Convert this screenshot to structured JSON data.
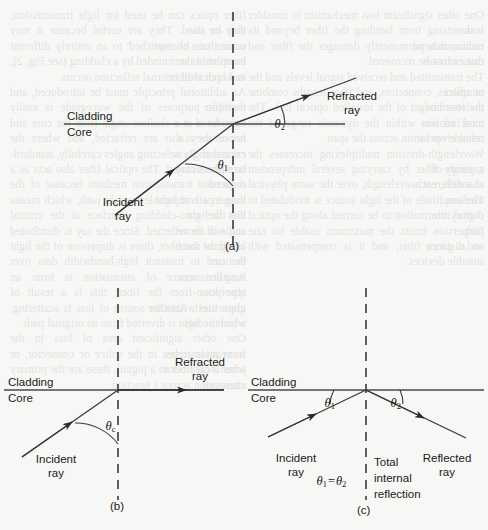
{
  "figure": {
    "kind": "optics-refraction-total-internal-reflection",
    "background_color": "#f7f7f5",
    "ink_color": "#2b2b2b",
    "panels": [
      {
        "id": "a",
        "id_label": "(a)",
        "interface_labels": {
          "upper": "Cladding",
          "lower": "Core"
        },
        "rays": [
          {
            "name": "incident",
            "label": "Incident\nray",
            "label_line1": "Incident",
            "label_line2": "ray"
          },
          {
            "name": "refracted",
            "label": "Refracted\nray",
            "label_line1": "Refracted",
            "label_line2": "ray"
          }
        ],
        "angles": [
          {
            "name": "theta-1",
            "symbol": "θ",
            "subscript": "1"
          },
          {
            "name": "theta-2",
            "symbol": "θ",
            "subscript": "2"
          }
        ],
        "normal": "vertical dashed normal line"
      },
      {
        "id": "b",
        "id_label": "(b)",
        "interface_labels": {
          "upper": "Cladding",
          "lower": "Core"
        },
        "rays": [
          {
            "name": "incident",
            "label_line1": "Incident",
            "label_line2": "ray"
          },
          {
            "name": "refracted",
            "label_line1": "Refracted",
            "label_line2": "ray"
          }
        ],
        "angles": [
          {
            "name": "theta-c",
            "symbol": "θ",
            "subscript": "c"
          }
        ],
        "normal": "vertical dashed normal line"
      },
      {
        "id": "c",
        "id_label": "(c)",
        "interface_labels": {
          "upper": "Cladding",
          "lower": "Core"
        },
        "rays": [
          {
            "name": "incident",
            "label_line1": "Incident",
            "label_line2": "ray"
          },
          {
            "name": "reflected",
            "label_line1": "Reflected",
            "label_line2": "ray"
          }
        ],
        "angles": [
          {
            "name": "theta-1",
            "symbol": "θ",
            "subscript": "1"
          },
          {
            "name": "theta-2",
            "symbol": "θ",
            "subscript": "2"
          }
        ],
        "equation": {
          "lhs_symbol": "θ",
          "lhs_sub": "1",
          "operator": "=",
          "rhs_symbol": "θ",
          "rhs_sub": "2"
        },
        "annotation_lines": [
          "Total",
          "internal",
          "reflection"
        ],
        "normal": "vertical dashed normal line"
      }
    ]
  },
  "ghost_text": {
    "note": "faint show-through text from the reverse side of the printed page",
    "column_left": [
      "fiber optics can be used for light transmission; they are also",
      "also be used. They are useful because it may occur that a change",
      "source can be 'switched' to an entirely different location in the",
      "complete is surrounded by a cladding (see Fig. 2), and optical fiber",
      "in which total internal reflection occurs.",
      "An additional principle must be introduced, and therefore",
      "multiple purposes of the waveguide is easily considered in a",
      "light hit it at a shallow angle from the core and not escape at a",
      "hence they also are refracted, and where the critical angle is",
      "exceeded. By selecting angles carefully, standard-size fibers may",
      "be manufactured. The optical fiber also acts as a reduced-",
      "dispersion transmission medium because of the longer path of light",
      "than in a comparable straight path, which means that the light",
      "hits the core-cladding interface at the critical angle or above",
      "and will be reflected. Since the ray is distributed along the same",
      "length of the fiber, there is dispersion of the light that can",
      "be used to transmit high-bandwidth data over long distances.",
      "Another source of attenuation is from an absorption-",
      "type loss from the fiber; this is a result of impurities within the",
      "glass itself. Another source of loss is scattering, which occurs",
      "when the light is diverted from its original path.",
      "One other significant area of loss in the waveguide arises",
      "from mismatches in the splice or connector, or when a connector",
      "joins local fiber to a pigtail; these are the primary causes of",
      "attenuation across a junction."
    ],
    "column_right": [
      "One other significant loss mechanism to consider is the",
      "loss arising from bending the fiber beyond its minimum bend",
      "radius; this permanently damages the fiber and causes losses",
      "that cannot be recovered.",
      "The transmitted and received signal levels and the numbers",
      "of splices, connectors, and fiber lengths combine to determine",
      "the loss budget of the installed optical link. The total link loss",
      "must remain within the dynamic range of the transceiver for",
      "reliable operation across the span.",
      "Wavelength-division multiplexing increases the capacity of",
      "a single fiber by carrying several independent channels, each",
      "at a different wavelength, over the same physical medium.",
      "The amplitude of the light source is modulated to convey the",
      "digital information to be carried along the optical path.",
      "Dispersion limits the maximum usable bit rate and distance",
      "on a given fiber, and it is compensated with suitable devices."
    ]
  }
}
